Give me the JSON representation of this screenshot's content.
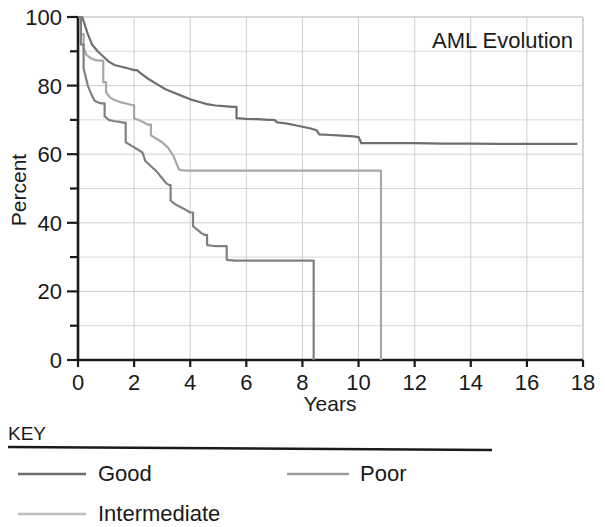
{
  "chart_data": {
    "type": "line",
    "title": "AML Evolution",
    "xlabel": "Years",
    "ylabel": "Percent",
    "xlim": [
      0,
      18
    ],
    "ylim": [
      0,
      100
    ],
    "xticks": [
      0,
      2,
      4,
      6,
      8,
      10,
      12,
      14,
      16,
      18
    ],
    "yticks": [
      0,
      20,
      40,
      60,
      80,
      100
    ],
    "xtick_labels": [
      "0",
      "2",
      "4",
      "6",
      "8",
      "10",
      "12",
      "14",
      "16",
      "18"
    ],
    "ytick_labels": [
      "0",
      "20",
      "40",
      "60",
      "80",
      "100"
    ],
    "grid": true,
    "grid_x_step": 2,
    "grid_y_step": 10,
    "legend_position": "below-plot",
    "legend_title": "KEY",
    "series": [
      {
        "name": "Good",
        "color": "#6e6e6e",
        "points": [
          [
            0.0,
            100
          ],
          [
            0.15,
            100
          ],
          [
            0.35,
            95
          ],
          [
            0.5,
            92
          ],
          [
            0.7,
            90
          ],
          [
            0.9,
            88.5
          ],
          [
            1.1,
            87
          ],
          [
            1.3,
            86
          ],
          [
            1.55,
            85.5
          ],
          [
            1.8,
            85
          ],
          [
            2.0,
            84.5
          ],
          [
            2.1,
            84.5
          ],
          [
            2.25,
            83.5
          ],
          [
            2.5,
            82
          ],
          [
            2.8,
            80.5
          ],
          [
            3.1,
            79
          ],
          [
            3.4,
            78
          ],
          [
            3.7,
            77
          ],
          [
            4.0,
            76
          ],
          [
            4.3,
            75.3
          ],
          [
            4.6,
            74.6
          ],
          [
            4.9,
            74.2
          ],
          [
            5.2,
            74
          ],
          [
            5.5,
            73.8
          ],
          [
            5.6,
            73.8
          ],
          [
            5.65,
            70.5
          ],
          [
            6.0,
            70.3
          ],
          [
            6.4,
            70.2
          ],
          [
            6.8,
            70.0
          ],
          [
            7.0,
            70.0
          ],
          [
            7.1,
            69.3
          ],
          [
            7.4,
            69.0
          ],
          [
            7.7,
            68.5
          ],
          [
            8.0,
            68.0
          ],
          [
            8.3,
            67.5
          ],
          [
            8.5,
            67.0
          ],
          [
            8.6,
            65.8
          ],
          [
            9.0,
            65.6
          ],
          [
            9.4,
            65.4
          ],
          [
            9.8,
            65.2
          ],
          [
            10.0,
            65.0
          ],
          [
            10.1,
            63.2
          ],
          [
            11.0,
            63.2
          ],
          [
            12.0,
            63.2
          ],
          [
            13.0,
            63.1
          ],
          [
            14.0,
            63.1
          ],
          [
            15.0,
            63.0
          ],
          [
            16.0,
            63.0
          ],
          [
            17.0,
            63.0
          ],
          [
            17.8,
            63.0
          ]
        ]
      },
      {
        "name": "Intermediate",
        "color": "#a8a8a8",
        "points": [
          [
            0.0,
            100
          ],
          [
            0.1,
            95
          ],
          [
            0.2,
            91
          ],
          [
            0.3,
            89
          ],
          [
            0.45,
            88
          ],
          [
            0.6,
            87.5
          ],
          [
            0.75,
            87.3
          ],
          [
            0.85,
            87.3
          ],
          [
            0.9,
            81
          ],
          [
            1.0,
            78
          ],
          [
            1.15,
            76.5
          ],
          [
            1.3,
            75.8
          ],
          [
            1.5,
            75.2
          ],
          [
            1.7,
            74.8
          ],
          [
            1.85,
            74.5
          ],
          [
            1.95,
            74.3
          ],
          [
            2.0,
            70.5
          ],
          [
            2.2,
            69.8
          ],
          [
            2.4,
            69.0
          ],
          [
            2.5,
            68.6
          ],
          [
            2.6,
            65.5
          ],
          [
            2.8,
            64.5
          ],
          [
            3.0,
            63.5
          ],
          [
            3.2,
            62.0
          ],
          [
            3.4,
            59.5
          ],
          [
            3.5,
            57.5
          ],
          [
            3.6,
            55.5
          ],
          [
            3.75,
            55.3
          ],
          [
            4.0,
            55.2
          ],
          [
            4.5,
            55.2
          ],
          [
            5.0,
            55.2
          ],
          [
            6.0,
            55.2
          ],
          [
            7.0,
            55.2
          ],
          [
            8.0,
            55.2
          ],
          [
            9.0,
            55.2
          ],
          [
            10.0,
            55.2
          ],
          [
            10.7,
            55.2
          ],
          [
            10.78,
            55.2
          ],
          [
            10.8,
            0
          ]
        ]
      },
      {
        "name": "Poor",
        "color": "#808080",
        "points": [
          [
            0.0,
            100
          ],
          [
            0.1,
            92
          ],
          [
            0.2,
            85
          ],
          [
            0.35,
            80
          ],
          [
            0.5,
            77
          ],
          [
            0.6,
            75.5
          ],
          [
            0.75,
            75.0
          ],
          [
            0.85,
            74.8
          ],
          [
            0.95,
            71.0
          ],
          [
            1.1,
            70.0
          ],
          [
            1.3,
            69.6
          ],
          [
            1.5,
            69.4
          ],
          [
            1.6,
            69.2
          ],
          [
            1.7,
            63.5
          ],
          [
            1.9,
            62.5
          ],
          [
            2.1,
            61.5
          ],
          [
            2.3,
            60.5
          ],
          [
            2.4,
            58.0
          ],
          [
            2.6,
            56.5
          ],
          [
            2.8,
            55.0
          ],
          [
            3.0,
            53.0
          ],
          [
            3.15,
            51.5
          ],
          [
            3.25,
            51.0
          ],
          [
            3.3,
            46.5
          ],
          [
            3.45,
            45.5
          ],
          [
            3.6,
            44.8
          ],
          [
            3.75,
            44.2
          ],
          [
            3.9,
            43.5
          ],
          [
            4.0,
            43.0
          ],
          [
            4.1,
            39.0
          ],
          [
            4.25,
            38.0
          ],
          [
            4.4,
            37.0
          ],
          [
            4.5,
            36.5
          ],
          [
            4.6,
            33.5
          ],
          [
            4.8,
            33.3
          ],
          [
            5.0,
            33.2
          ],
          [
            5.2,
            33.2
          ],
          [
            5.3,
            29.2
          ],
          [
            5.6,
            29.0
          ],
          [
            6.0,
            29.0
          ],
          [
            6.5,
            29.0
          ],
          [
            7.0,
            29.0
          ],
          [
            7.5,
            29.0
          ],
          [
            8.0,
            29.0
          ],
          [
            8.3,
            29.0
          ],
          [
            8.38,
            29.0
          ],
          [
            8.4,
            0
          ]
        ]
      }
    ],
    "legend_entries": [
      {
        "label": "Good",
        "color": "#6e6e6e"
      },
      {
        "label": "Poor",
        "color": "#9a9a9a"
      },
      {
        "label": "Intermediate",
        "color": "#bdbdbd"
      }
    ]
  },
  "colors": {
    "axis": "#1a1a1a",
    "grid": "#c9c9c9",
    "background": "#ffffff",
    "key_rule": "#1a1a1a"
  }
}
